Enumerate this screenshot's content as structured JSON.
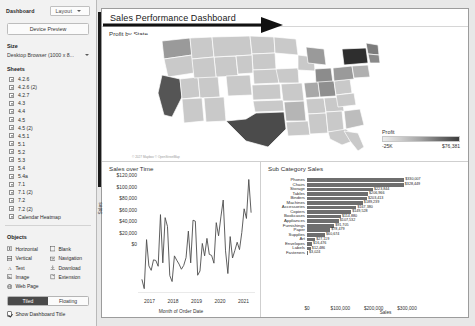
{
  "sidebar": {
    "tab_dashboard": "Dashboard",
    "tab_layout": "Layout",
    "device_preview": "Device Preview",
    "size_heading": "Size",
    "size_value": "Desktop Browser (1000 x 8...",
    "sheets_heading": "Sheets",
    "sheets": [
      {
        "label": "4.2.6",
        "icon": "sheet-icon"
      },
      {
        "label": "4.2.6 (2)",
        "icon": "sheet-icon"
      },
      {
        "label": "4.2.7",
        "icon": "sheet-icon"
      },
      {
        "label": "4.3",
        "icon": "sheet-icon"
      },
      {
        "label": "4.4",
        "icon": "sheet-icon"
      },
      {
        "label": "4.5",
        "icon": "sheet-icon"
      },
      {
        "label": "4.5 (2)",
        "icon": "sheet-icon"
      },
      {
        "label": "4.5.1",
        "icon": "sheet-icon"
      },
      {
        "label": "5.1",
        "icon": "sheet-icon"
      },
      {
        "label": "5.2",
        "icon": "sheet-icon"
      },
      {
        "label": "5.3",
        "icon": "sheet-icon"
      },
      {
        "label": "5.4",
        "icon": "sheet-icon"
      },
      {
        "label": "5.4a",
        "icon": "sheet-icon"
      },
      {
        "label": "7.1",
        "icon": "sheet-icon"
      },
      {
        "label": "7.1 (2)",
        "icon": "sheet-icon"
      },
      {
        "label": "7.2",
        "icon": "sheet-icon"
      },
      {
        "label": "7.2 (2)",
        "icon": "sheet-icon"
      },
      {
        "label": "Calendar Heatmap",
        "icon": "sheet-icon"
      }
    ],
    "objects_heading": "Objects",
    "objects": [
      {
        "label": "Horizontal",
        "icon": "horizontal-layout-icon"
      },
      {
        "label": "Blank",
        "icon": "blank-icon"
      },
      {
        "label": "Vertical",
        "icon": "vertical-layout-icon"
      },
      {
        "label": "Navigation",
        "icon": "navigation-icon"
      },
      {
        "label": "Text",
        "icon": "text-icon"
      },
      {
        "label": "Download",
        "icon": "download-icon"
      },
      {
        "label": "Image",
        "icon": "image-icon"
      },
      {
        "label": "Extension",
        "icon": "extension-icon"
      },
      {
        "label": "Web Page",
        "icon": "web-page-icon"
      }
    ],
    "tiled_label": "Tiled",
    "floating_label": "Floating",
    "show_dashboard_title": "Show Dashboard Title"
  },
  "dashboard": {
    "title": "Sales Performance Dashboard",
    "map": {
      "title": "Profit by State",
      "credit": "© 2027 Mapbox © OpenStreetMap",
      "legend": {
        "title": "Profit",
        "min": "-25K",
        "max": "$76,381"
      }
    }
  },
  "chart_data": [
    {
      "type": "line",
      "title": "Sales over Time",
      "xlabel": "Month of Order Date",
      "ylabel": "Sales",
      "ylim": [
        0,
        120000
      ],
      "yticks": [
        "$0",
        "$20,000",
        "$40,000",
        "$60,000",
        "$80,000",
        "$100,000",
        "$120,000"
      ],
      "xticks": [
        "2017",
        "2018",
        "2019",
        "2020",
        "2021"
      ],
      "grid": false,
      "x": [
        "2017-01",
        "2017-02",
        "2017-03",
        "2017-04",
        "2017-05",
        "2017-06",
        "2017-07",
        "2017-08",
        "2017-09",
        "2017-10",
        "2017-11",
        "2017-12",
        "2018-01",
        "2018-02",
        "2018-03",
        "2018-04",
        "2018-05",
        "2018-06",
        "2018-07",
        "2018-08",
        "2018-09",
        "2018-10",
        "2018-11",
        "2018-12",
        "2019-01",
        "2019-02",
        "2019-03",
        "2019-04",
        "2019-05",
        "2019-06",
        "2019-07",
        "2019-08",
        "2019-09",
        "2019-10",
        "2019-11",
        "2019-12",
        "2020-01",
        "2020-02",
        "2020-03",
        "2020-04",
        "2020-05",
        "2020-06",
        "2020-07",
        "2020-08",
        "2020-09",
        "2020-10",
        "2020-11",
        "2020-12"
      ],
      "values": [
        14236,
        4520,
        55691,
        28295,
        23648,
        34595,
        33946,
        27909,
        81777,
        31453,
        78629,
        69545,
        18174,
        11951,
        38726,
        34196,
        30132,
        24797,
        28765,
        36898,
        64596,
        31404,
        75972,
        74919,
        18542,
        22979,
        51715,
        38750,
        56987,
        40344,
        39262,
        31115,
        73410,
        59688,
        79412,
        96999,
        43971,
        20301,
        58872,
        36522,
        44261,
        52982,
        45264,
        63121,
        87866,
        77776,
        118448,
        83829
      ]
    },
    {
      "type": "bar",
      "orientation": "horizontal",
      "title": "Sub Category Sales",
      "xlabel": "Sales",
      "xticks": [
        "$0",
        "$100,000",
        "$200,000",
        "$300,000"
      ],
      "xlim": [
        0,
        340000
      ],
      "categories": [
        "Phones",
        "Chairs",
        "Storage",
        "Tables",
        "Binders",
        "Machines",
        "Accessories",
        "Copiers",
        "Bookcases",
        "Appliances",
        "Furnishings",
        "Paper",
        "Supplies",
        "Art",
        "Envelopes",
        "Labels",
        "Fasteners"
      ],
      "values": [
        330007,
        328449,
        223844,
        206966,
        203413,
        189239,
        167380,
        149528,
        114880,
        107532,
        91705,
        78479,
        60674,
        27119,
        16476,
        12486,
        3024
      ],
      "value_labels": [
        "$330,007",
        "$328,449",
        "$223,844",
        "$206,966",
        "$203,413",
        "$189,239",
        "$167,380",
        "$149,528",
        "$114,880",
        "$107,532",
        "$91,705",
        "$78,479",
        "$60,674",
        "$27,119",
        "$16,476",
        "$12,486",
        "$3,024"
      ]
    }
  ]
}
